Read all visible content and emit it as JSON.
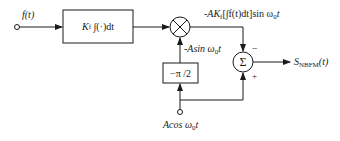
{
  "diagram": {
    "input": {
      "label": "f(t)"
    },
    "integrator_block": {
      "gain": "K",
      "gain_sub": "f",
      "expr": "∫(·)dt"
    },
    "multiplier": {
      "symbol": "×"
    },
    "multiplier_output": {
      "prefix": "-AK",
      "sub": "f",
      "body": "[∫f(t)dt]sin ω",
      "sub2": "0",
      "tail": "t"
    },
    "phase_shift_block": {
      "label": "−π /2"
    },
    "phase_shift_output": {
      "prefix": "-Asin ω",
      "sub": "0",
      "tail": "t"
    },
    "summer": {
      "symbol": "Σ",
      "sign_top": "−",
      "sign_bottom": "+"
    },
    "output": {
      "prefix": "S",
      "sub": "NBFM",
      "tail": "(t)"
    },
    "carrier_input": {
      "prefix": "Acos ω",
      "sub": "0",
      "tail": "t"
    },
    "colors": {
      "stroke": "#1a1a1a",
      "background": "#ffffff"
    }
  }
}
